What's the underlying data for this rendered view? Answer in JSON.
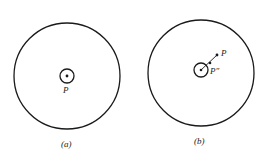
{
  "figures": [
    {
      "caption": "(a)",
      "center_label": "P",
      "big_circle": {
        "cx": 67,
        "cy": 76,
        "r": 53
      },
      "small_circle": {
        "cx": 67,
        "cy": 76,
        "r": 7
      }
    },
    {
      "caption": "(b)",
      "point_label": "P",
      "center_label": "P″",
      "big_circle": {
        "cx": 201,
        "cy": 73,
        "r": 53
      },
      "small_circle": {
        "cx": 201,
        "cy": 70,
        "r": 7
      }
    }
  ],
  "colors": {
    "stroke": "#1a1a1a",
    "background": "#ffffff"
  }
}
